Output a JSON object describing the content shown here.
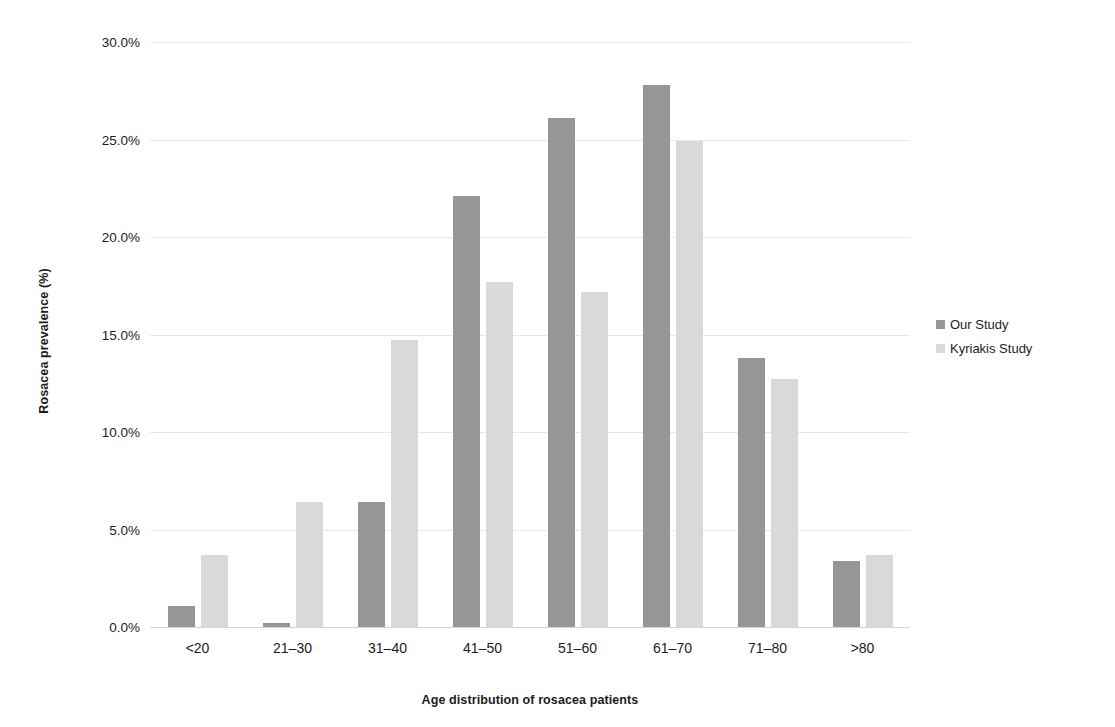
{
  "chart_data": {
    "type": "bar",
    "title": "",
    "xlabel": "Age distribution of rosacea patients",
    "ylabel": "Rosacea prevalence (%)",
    "categories": [
      "<20",
      "21–30",
      "31–40",
      "41–50",
      "51–60",
      "61–70",
      "71–80",
      ">80"
    ],
    "series": [
      {
        "name": "Our Study",
        "color": "#969696",
        "values": [
          1.1,
          0.2,
          6.4,
          22.1,
          26.1,
          27.8,
          13.8,
          3.4
        ]
      },
      {
        "name": "Kyriakis Study",
        "color": "#d9d9d9",
        "values": [
          3.7,
          6.4,
          14.7,
          17.7,
          17.2,
          24.9,
          12.7,
          3.7
        ]
      }
    ],
    "ylim": [
      0,
      30
    ],
    "ytick_values": [
      0,
      5,
      10,
      15,
      20,
      25,
      30
    ],
    "ytick_labels": [
      "0.0%",
      "5.0%",
      "10.0%",
      "15.0%",
      "20.0%",
      "25.0%",
      "30.0%"
    ],
    "grid": true,
    "legend_position": "right"
  },
  "legend": {
    "items": [
      {
        "label": "Our Study",
        "color": "#969696"
      },
      {
        "label": "Kyriakis Study",
        "color": "#d9d9d9"
      }
    ]
  },
  "axes": {
    "y_title": "Rosacea prevalence (%)",
    "x_title": "Age distribution of rosacea patients"
  }
}
